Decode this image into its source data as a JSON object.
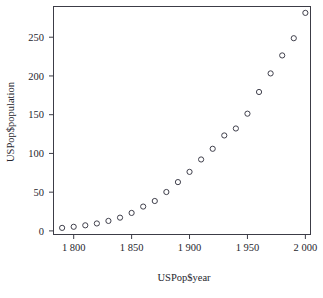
{
  "chart_data": {
    "type": "scatter",
    "title": "",
    "xlabel": "USPop$year",
    "ylabel": "USPop$population",
    "x": [
      1790,
      1800,
      1810,
      1820,
      1830,
      1840,
      1850,
      1860,
      1870,
      1880,
      1890,
      1900,
      1910,
      1920,
      1930,
      1940,
      1950,
      1960,
      1970,
      1980,
      1990,
      2000
    ],
    "values": [
      3.9,
      5.3,
      7.2,
      9.6,
      12.9,
      17.1,
      23.2,
      31.4,
      38.6,
      50.2,
      63.0,
      76.2,
      92.2,
      106.0,
      123.2,
      132.2,
      151.3,
      179.3,
      203.3,
      226.5,
      248.7,
      281.4
    ],
    "xlim": [
      1783,
      2004
    ],
    "ylim": [
      -4,
      289
    ],
    "xticks": [
      1800,
      1850,
      1900,
      1950,
      2000
    ],
    "xticklabels": [
      "1 800",
      "1 850",
      "1 900",
      "1 950",
      "2 000"
    ],
    "yticks": [
      0,
      50,
      100,
      150,
      200,
      250
    ],
    "yticklabels": [
      "0",
      "50",
      "100",
      "150",
      "200",
      "250"
    ],
    "grid": false,
    "legend": false,
    "marker": "open-circle",
    "marker_color": "#40404c",
    "frame_color": "#3c3c46",
    "background": "#ffffff"
  }
}
